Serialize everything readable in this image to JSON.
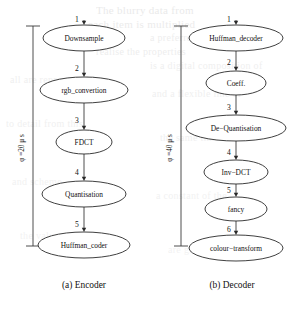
{
  "figure": {
    "background_bleed": [
      {
        "text": "The blurry data from",
        "x": 96,
        "y": 4,
        "size": 11,
        "opacity": 0.55
      },
      {
        "text": "each item is multiplied",
        "x": 88,
        "y": 18,
        "size": 11,
        "opacity": 0.5
      },
      {
        "text": "a preferred state of a",
        "x": 150,
        "y": 32,
        "size": 10,
        "opacity": 0.45
      },
      {
        "text": "realise the properties",
        "x": 96,
        "y": 46,
        "size": 10,
        "opacity": 0.45
      },
      {
        "text": "is a digital composition of",
        "x": 150,
        "y": 60,
        "size": 10,
        "opacity": 0.4
      },
      {
        "text": "all are represented in",
        "x": 10,
        "y": 74,
        "size": 10,
        "opacity": 0.4
      },
      {
        "text": "and a flexible line of",
        "x": 152,
        "y": 88,
        "size": 10,
        "opacity": 0.4
      },
      {
        "text": "to detail from this",
        "x": 6,
        "y": 118,
        "size": 10,
        "opacity": 0.38
      },
      {
        "text": "the same time",
        "x": 160,
        "y": 132,
        "size": 10,
        "opacity": 0.38
      },
      {
        "text": "and scheme",
        "x": 12,
        "y": 176,
        "size": 10,
        "opacity": 0.35
      },
      {
        "text": "a constant of the",
        "x": 156,
        "y": 190,
        "size": 10,
        "opacity": 0.35
      },
      {
        "text": "the value",
        "x": 20,
        "y": 230,
        "size": 10,
        "opacity": 0.33
      },
      {
        "text": "are given",
        "x": 168,
        "y": 244,
        "size": 10,
        "opacity": 0.33
      }
    ]
  },
  "graphs": [
    {
      "id": "encoder",
      "caption": "(a) Encoder",
      "caption_x": 84,
      "caption_y": 288,
      "period_label": "φ =20 μ s",
      "period_value": 20,
      "period_unit": "μs",
      "bracket": {
        "x": 33,
        "top": 26,
        "bottom": 246,
        "cap_half_width": 7,
        "label_x": 24,
        "label_y": 148
      },
      "center_x": 84,
      "nodes": [
        {
          "index": 1,
          "label": "Downsample",
          "cx": 84,
          "cy": 38,
          "rx": 41,
          "ry": 13
        },
        {
          "index": 2,
          "label": "rgb_convertion",
          "cx": 84,
          "cy": 90,
          "rx": 44,
          "ry": 13
        },
        {
          "index": 3,
          "label": "FDCT",
          "cx": 84,
          "cy": 142,
          "rx": 28,
          "ry": 12
        },
        {
          "index": 4,
          "label": "Quantisation",
          "cx": 84,
          "cy": 194,
          "rx": 42,
          "ry": 13
        },
        {
          "index": 5,
          "label": "Huffman_coder",
          "cx": 84,
          "cy": 245,
          "rx": 46,
          "ry": 13
        }
      ],
      "edges": [
        {
          "number": "1",
          "from": null,
          "to": 1,
          "x": 84,
          "y1": 20,
          "y2": 25,
          "num_x": 77,
          "num_y": 22
        },
        {
          "number": "2",
          "from": 1,
          "to": 2,
          "x": 84,
          "y1": 51,
          "y2": 77,
          "num_x": 77,
          "num_y": 71
        },
        {
          "number": "3",
          "from": 2,
          "to": 3,
          "x": 84,
          "y1": 103,
          "y2": 130,
          "num_x": 77,
          "num_y": 123
        },
        {
          "number": "4",
          "from": 3,
          "to": 4,
          "x": 84,
          "y1": 154,
          "y2": 181,
          "num_x": 77,
          "num_y": 175
        },
        {
          "number": "5",
          "from": 4,
          "to": 5,
          "x": 84,
          "y1": 207,
          "y2": 232,
          "num_x": 77,
          "num_y": 227
        }
      ]
    },
    {
      "id": "decoder",
      "caption": "(b) Decoder",
      "caption_x": 232,
      "caption_y": 288,
      "period_label": "φ =40 μ s",
      "period_value": 40,
      "period_unit": "μs",
      "bracket": {
        "x": 181,
        "top": 26,
        "bottom": 246,
        "cap_half_width": 7,
        "label_x": 172,
        "label_y": 148
      },
      "center_x": 236,
      "nodes": [
        {
          "index": 1,
          "label": "Huffman_decoder",
          "cx": 236,
          "cy": 38,
          "rx": 47,
          "ry": 13
        },
        {
          "index": 2,
          "label": "Coeff.",
          "cx": 236,
          "cy": 83,
          "rx": 30,
          "ry": 12
        },
        {
          "index": 3,
          "label": "De−Quantisation",
          "cx": 236,
          "cy": 128,
          "rx": 50,
          "ry": 13
        },
        {
          "index": 4,
          "label": "Inv−DCT",
          "cx": 236,
          "cy": 172,
          "rx": 32,
          "ry": 12
        },
        {
          "index": 5,
          "label": "fancy",
          "cx": 236,
          "cy": 209,
          "rx": 31,
          "ry": 12
        },
        {
          "index": 6,
          "label": "colour−transform",
          "cx": 236,
          "cy": 248,
          "rx": 47,
          "ry": 13
        }
      ],
      "edges": [
        {
          "number": "1",
          "from": null,
          "to": 1,
          "x": 236,
          "y1": 20,
          "y2": 25,
          "num_x": 229,
          "num_y": 22
        },
        {
          "number": "2",
          "from": 1,
          "to": 2,
          "x": 236,
          "y1": 51,
          "y2": 71,
          "num_x": 229,
          "num_y": 65
        },
        {
          "number": "3",
          "from": 2,
          "to": 3,
          "x": 236,
          "y1": 95,
          "y2": 115,
          "num_x": 229,
          "num_y": 110
        },
        {
          "number": "4",
          "from": 3,
          "to": 4,
          "x": 236,
          "y1": 141,
          "y2": 160,
          "num_x": 229,
          "num_y": 155
        },
        {
          "number": "5",
          "from": 4,
          "to": 5,
          "x": 236,
          "y1": 184,
          "y2": 197,
          "num_x": 229,
          "num_y": 193
        },
        {
          "number": "6",
          "from": 5,
          "to": 6,
          "x": 236,
          "y1": 221,
          "y2": 235,
          "num_x": 229,
          "num_y": 232
        }
      ]
    }
  ]
}
